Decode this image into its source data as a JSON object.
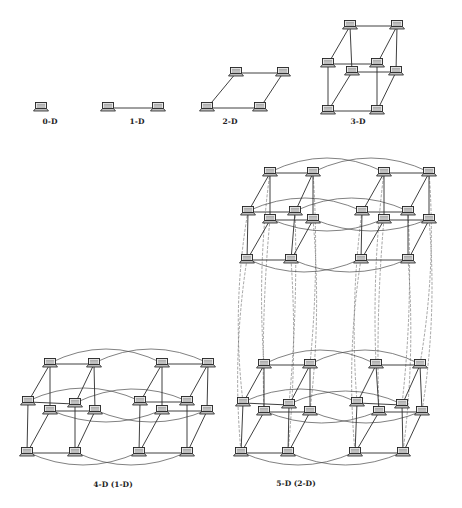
{
  "figure": {
    "colors": {
      "line": "#2a2a2a",
      "node_body": "#e8e8e8",
      "node_outline": "#222222",
      "background": "#ffffff"
    }
  },
  "diagrams": [
    {
      "id": "0d",
      "label": "0-D",
      "label_pos": [
        50,
        124
      ],
      "nodes": [
        [
          41,
          107
        ]
      ],
      "edges": [],
      "arcs": []
    },
    {
      "id": "1d",
      "label": "1-D",
      "label_pos": [
        137,
        124
      ],
      "nodes": [
        [
          108,
          107
        ],
        [
          158,
          107
        ]
      ],
      "edges": [
        [
          0,
          1
        ]
      ],
      "arcs": []
    },
    {
      "id": "2d",
      "label": "2-D",
      "label_pos": [
        230,
        124
      ],
      "nodes": [
        [
          207,
          107
        ],
        [
          260,
          107
        ],
        [
          236,
          72
        ],
        [
          283,
          72
        ]
      ],
      "edges": [
        [
          0,
          1
        ],
        [
          2,
          3
        ],
        [
          0,
          2
        ],
        [
          1,
          3
        ]
      ],
      "arcs": []
    },
    {
      "id": "3d",
      "label": "3-D",
      "label_pos": [
        358,
        124
      ],
      "nodes": [
        [
          350,
          25
        ],
        [
          397,
          25
        ],
        [
          328,
          63
        ],
        [
          377,
          63
        ],
        [
          352,
          71
        ],
        [
          396,
          71
        ],
        [
          328,
          110
        ],
        [
          377,
          110
        ]
      ],
      "edges": [
        [
          0,
          1
        ],
        [
          0,
          2
        ],
        [
          1,
          3
        ],
        [
          2,
          3
        ],
        [
          0,
          4
        ],
        [
          1,
          5
        ],
        [
          4,
          5
        ],
        [
          2,
          6
        ],
        [
          3,
          7
        ],
        [
          6,
          7
        ],
        [
          4,
          6
        ],
        [
          5,
          7
        ]
      ],
      "arcs": []
    },
    {
      "id": "4d",
      "label": "4-D (1-D)",
      "label_pos": [
        113,
        487
      ],
      "nodes": [
        [
          50,
          363
        ],
        [
          94,
          363
        ],
        [
          28,
          401
        ],
        [
          75,
          403
        ],
        [
          50,
          410
        ],
        [
          95,
          410
        ],
        [
          27,
          452
        ],
        [
          75,
          452
        ],
        [
          162,
          363
        ],
        [
          208,
          363
        ],
        [
          140,
          401
        ],
        [
          187,
          401
        ],
        [
          162,
          410
        ],
        [
          207,
          410
        ],
        [
          139,
          452
        ],
        [
          187,
          452
        ]
      ],
      "edges": [
        [
          0,
          1
        ],
        [
          0,
          2
        ],
        [
          1,
          3
        ],
        [
          2,
          3
        ],
        [
          0,
          4
        ],
        [
          1,
          5
        ],
        [
          4,
          5
        ],
        [
          2,
          6
        ],
        [
          3,
          7
        ],
        [
          6,
          7
        ],
        [
          4,
          6
        ],
        [
          5,
          7
        ],
        [
          8,
          9
        ],
        [
          8,
          10
        ],
        [
          9,
          11
        ],
        [
          10,
          11
        ],
        [
          8,
          12
        ],
        [
          9,
          13
        ],
        [
          12,
          13
        ],
        [
          10,
          14
        ],
        [
          11,
          15
        ],
        [
          14,
          15
        ],
        [
          12,
          14
        ],
        [
          13,
          15
        ]
      ],
      "arcs": [
        [
          0,
          8,
          -28
        ],
        [
          1,
          9,
          -28
        ],
        [
          2,
          10,
          -26
        ],
        [
          3,
          11,
          -26
        ],
        [
          4,
          12,
          24
        ],
        [
          5,
          13,
          24
        ],
        [
          6,
          14,
          26
        ],
        [
          7,
          15,
          26
        ]
      ]
    },
    {
      "id": "5d",
      "label": "5-D (2-D)",
      "label_pos": [
        296,
        486
      ],
      "nodes": [
        [
          270,
          172
        ],
        [
          313,
          172
        ],
        [
          248,
          211
        ],
        [
          295,
          211
        ],
        [
          270,
          219
        ],
        [
          313,
          219
        ],
        [
          247,
          259
        ],
        [
          291,
          259
        ],
        [
          384,
          172
        ],
        [
          429,
          172
        ],
        [
          362,
          211
        ],
        [
          408,
          211
        ],
        [
          384,
          219
        ],
        [
          429,
          219
        ],
        [
          361,
          259
        ],
        [
          408,
          259
        ],
        [
          264,
          364
        ],
        [
          310,
          364
        ],
        [
          243,
          402
        ],
        [
          289,
          404
        ],
        [
          264,
          411
        ],
        [
          310,
          411
        ],
        [
          241,
          452
        ],
        [
          288,
          452
        ],
        [
          376,
          364
        ],
        [
          420,
          364
        ],
        [
          357,
          402
        ],
        [
          402,
          404
        ],
        [
          379,
          411
        ],
        [
          422,
          411
        ],
        [
          355,
          452
        ],
        [
          403,
          452
        ]
      ],
      "edges": [
        [
          0,
          1
        ],
        [
          0,
          2
        ],
        [
          1,
          3
        ],
        [
          2,
          3
        ],
        [
          0,
          4
        ],
        [
          1,
          5
        ],
        [
          4,
          5
        ],
        [
          2,
          6
        ],
        [
          3,
          7
        ],
        [
          6,
          7
        ],
        [
          4,
          6
        ],
        [
          5,
          7
        ],
        [
          8,
          9
        ],
        [
          8,
          10
        ],
        [
          9,
          11
        ],
        [
          10,
          11
        ],
        [
          8,
          12
        ],
        [
          9,
          13
        ],
        [
          12,
          13
        ],
        [
          10,
          14
        ],
        [
          11,
          15
        ],
        [
          14,
          15
        ],
        [
          12,
          14
        ],
        [
          13,
          15
        ],
        [
          16,
          17
        ],
        [
          16,
          18
        ],
        [
          17,
          19
        ],
        [
          18,
          19
        ],
        [
          16,
          20
        ],
        [
          17,
          21
        ],
        [
          20,
          21
        ],
        [
          18,
          22
        ],
        [
          19,
          23
        ],
        [
          22,
          23
        ],
        [
          20,
          22
        ],
        [
          21,
          23
        ],
        [
          24,
          25
        ],
        [
          24,
          26
        ],
        [
          25,
          27
        ],
        [
          26,
          27
        ],
        [
          24,
          28
        ],
        [
          25,
          29
        ],
        [
          28,
          29
        ],
        [
          26,
          30
        ],
        [
          27,
          31
        ],
        [
          30,
          31
        ],
        [
          28,
          30
        ],
        [
          29,
          31
        ]
      ],
      "arcs": [
        [
          0,
          8,
          -28
        ],
        [
          1,
          9,
          -28
        ],
        [
          2,
          10,
          -26
        ],
        [
          3,
          11,
          -26
        ],
        [
          4,
          12,
          24
        ],
        [
          5,
          13,
          24
        ],
        [
          6,
          14,
          26
        ],
        [
          7,
          15,
          26
        ],
        [
          16,
          24,
          -28
        ],
        [
          17,
          25,
          -28
        ],
        [
          18,
          26,
          -26
        ],
        [
          19,
          27,
          -26
        ],
        [
          20,
          28,
          24
        ],
        [
          21,
          29,
          24
        ],
        [
          22,
          30,
          26
        ],
        [
          23,
          31,
          26
        ]
      ],
      "vertical_arcs": [
        [
          0,
          16,
          -10
        ],
        [
          1,
          17,
          8
        ],
        [
          2,
          18,
          -14
        ],
        [
          3,
          19,
          6
        ],
        [
          4,
          20,
          -6
        ],
        [
          5,
          21,
          10
        ],
        [
          6,
          22,
          -12
        ],
        [
          7,
          23,
          8
        ],
        [
          8,
          24,
          -8
        ],
        [
          9,
          25,
          12
        ],
        [
          10,
          26,
          -10
        ],
        [
          11,
          27,
          8
        ],
        [
          12,
          28,
          -6
        ],
        [
          13,
          29,
          12
        ],
        [
          14,
          30,
          -12
        ],
        [
          15,
          31,
          10
        ]
      ]
    }
  ],
  "labels": {
    "d0": "0-D",
    "d1": "1-D",
    "d2": "2-D",
    "d3": "3-D",
    "d4": "4-D (1-D)",
    "d5": "5-D (2-D)"
  }
}
